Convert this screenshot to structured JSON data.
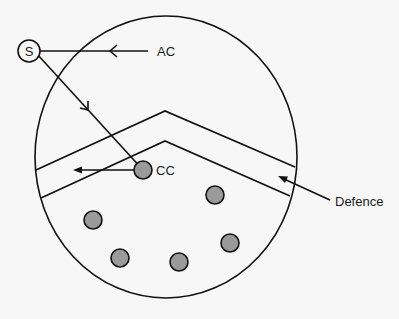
{
  "diagram": {
    "type": "defence-penetration-schematic",
    "colors": {
      "background": "#f7f7f7",
      "stroke": "#111111",
      "node_fill": "#9a9a9a"
    },
    "labels": {
      "source": "S",
      "ac": "AC",
      "cc": "CC",
      "defence": "Defence"
    },
    "nodes": {
      "source": {
        "cx": 29,
        "cy": 51,
        "r": 11
      },
      "cc": {
        "cx": 143,
        "cy": 170,
        "r": 9
      },
      "dots": [
        {
          "cx": 93,
          "cy": 220,
          "r": 9
        },
        {
          "cx": 215,
          "cy": 195,
          "r": 9
        },
        {
          "cx": 120,
          "cy": 258,
          "r": 9
        },
        {
          "cx": 179,
          "cy": 262,
          "r": 9
        },
        {
          "cx": 230,
          "cy": 243,
          "r": 9
        }
      ]
    },
    "boundary": {
      "cx": 166,
      "cy": 157,
      "rx": 131,
      "ry": 141
    },
    "defence_band": {
      "upper": [
        [
          36,
          170
        ],
        [
          165,
          111
        ],
        [
          295,
          167
        ]
      ],
      "lower": [
        [
          41,
          198
        ],
        [
          165,
          141
        ],
        [
          290,
          196
        ]
      ]
    }
  }
}
